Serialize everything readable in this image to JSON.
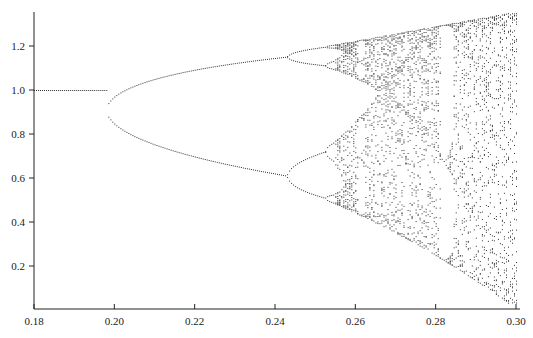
{
  "chart_data": {
    "type": "scatter",
    "title": "",
    "xlabel": "",
    "ylabel": "",
    "xlim": [
      0.18,
      0.3
    ],
    "ylim": [
      0.0,
      1.36
    ],
    "grid": false,
    "legend": null,
    "x_ticks": [
      0.18,
      0.2,
      0.22,
      0.24,
      0.26,
      0.28,
      0.3
    ],
    "x_tick_labels": [
      "0.18",
      "0.20",
      "0.22",
      "0.24",
      "0.26",
      "0.28",
      "0.30"
    ],
    "y_ticks": [
      0.2,
      0.4,
      0.6,
      0.8,
      1.0,
      1.2
    ],
    "y_tick_labels": [
      "0.2",
      "0.4",
      "0.6",
      "0.8",
      "1.0",
      "1.2"
    ],
    "key_points": [
      {
        "x": 0.18,
        "y": [
          1.0
        ]
      },
      {
        "x": 0.198,
        "y": [
          1.0
        ]
      },
      {
        "x": 0.22,
        "y": [
          1.18,
          0.8
        ]
      },
      {
        "x": 0.243,
        "y": [
          1.21,
          0.64
        ]
      },
      {
        "x": 0.25,
        "y": [
          1.24,
          1.15,
          0.73,
          0.58
        ]
      },
      {
        "x": 0.26,
        "y_range": [
          0.45,
          1.27
        ]
      },
      {
        "x": 0.28,
        "y_range": [
          0.2,
          1.31
        ]
      },
      {
        "x": 0.3,
        "y_range": [
          0.03,
          1.35
        ]
      }
    ],
    "generator": {
      "r_at_x0": 2.82,
      "r_slope": 9.98,
      "y_scale": 1.5,
      "iterations_discard": 300,
      "samples_per_column": 40,
      "columns": 240,
      "point_color": "#333333"
    }
  },
  "plot_area": {
    "x_axis_y": 309,
    "y_axis_x": 34,
    "x_pixel_min": 34,
    "x_pixel_max": 516,
    "y_pixel_zero": 310,
    "y_pixel_per_unit": 220,
    "y_axis_top": 12
  }
}
